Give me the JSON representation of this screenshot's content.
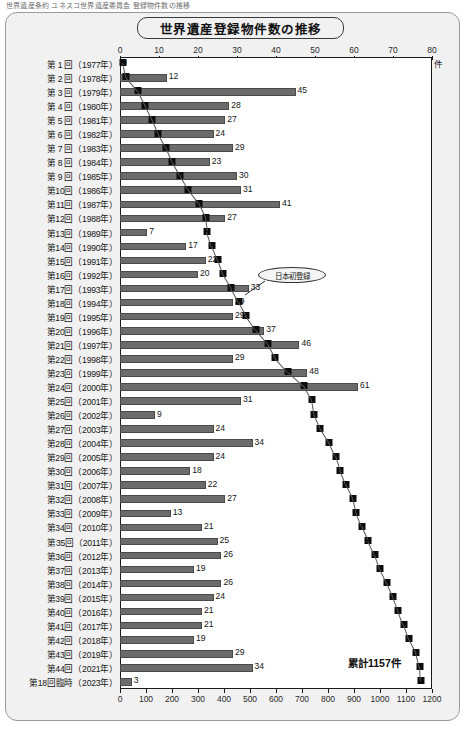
{
  "top_caption": "世界遺産条約 ユネスコ世界遺産委員会 登録物件数の推移",
  "panel": {
    "title": "世界遺産登録物件数の推移",
    "unit_top": "件",
    "total_label": "累計1157件",
    "annotation": "日本初登録"
  },
  "chart_data": {
    "type": "bar",
    "title": "世界遺産登録物件数の推移",
    "xlabel": "件",
    "ylabel": "",
    "grid": false,
    "legend": null,
    "axis_top": {
      "name": "新規登録件数",
      "ticks": [
        0,
        10,
        20,
        30,
        40,
        50,
        60,
        70,
        80
      ],
      "range": [
        0,
        80
      ],
      "unit": "件"
    },
    "axis_bottom": {
      "name": "累計登録件数",
      "ticks": [
        0,
        100,
        200,
        300,
        400,
        500,
        600,
        700,
        800,
        900,
        1000,
        1100,
        1200
      ],
      "range": [
        0,
        1200
      ]
    },
    "categories": [
      "第 1 回（1977年）",
      "第 2 回（1978年）",
      "第 3 回（1979年）",
      "第 4 回（1980年）",
      "第 5 回（1981年）",
      "第 6 回（1982年）",
      "第 7 回（1983年）",
      "第 8 回（1984年）",
      "第 9 回（1985年）",
      "第10回（1986年）",
      "第11回（1987年）",
      "第12回（1988年）",
      "第13回（1989年）",
      "第14回（1990年）",
      "第15回（1991年）",
      "第16回（1992年）",
      "第17回（1993年）",
      "第18回（1994年）",
      "第19回（1995年）",
      "第20回（1996年）",
      "第21回（1997年）",
      "第22回（1998年）",
      "第23回（1999年）",
      "第24回（2000年）",
      "第25回（2001年）",
      "第26回（2002年）",
      "第27回（2003年）",
      "第28回（2004年）",
      "第29回（2005年）",
      "第30回（2006年）",
      "第31回（2007年）",
      "第32回（2008年）",
      "第33回（2009年）",
      "第34回（2010年）",
      "第35回（2011年）",
      "第36回（2012年）",
      "第37回（2013年）",
      "第38回（2014年）",
      "第39回（2015年）",
      "第40回（2016年）",
      "第41回（2017年）",
      "第42回（2018年）",
      "第43回（2019年）",
      "第44回（2021年）",
      "第18回臨時（2023年）"
    ],
    "series": [
      {
        "name": "新規登録件数",
        "type": "bar",
        "axis": "top",
        "values": [
          0,
          12,
          45,
          28,
          27,
          24,
          29,
          23,
          30,
          31,
          41,
          27,
          7,
          17,
          22,
          20,
          33,
          29,
          29,
          37,
          46,
          29,
          48,
          61,
          31,
          9,
          24,
          34,
          24,
          18,
          22,
          27,
          13,
          21,
          25,
          26,
          19,
          26,
          24,
          21,
          21,
          19,
          29,
          34,
          3
        ]
      },
      {
        "name": "累計登録件数",
        "type": "line-marker",
        "axis": "bottom",
        "values": [
          12,
          24,
          69,
          97,
          124,
          148,
          177,
          200,
          230,
          261,
          302,
          329,
          336,
          353,
          375,
          395,
          428,
          457,
          486,
          523,
          569,
          598,
          646,
          707,
          738,
          747,
          771,
          805,
          829,
          847,
          869,
          896,
          909,
          930,
          955,
          981,
          1000,
          1026,
          1050,
          1071,
          1092,
          1111,
          1140,
          1154,
          1157
        ]
      }
    ],
    "annotations": [
      {
        "text": "日本初登録",
        "category": "第17回（1993年）"
      },
      {
        "text": "累計1157件",
        "category": "第18回臨時（2023年）"
      }
    ]
  }
}
